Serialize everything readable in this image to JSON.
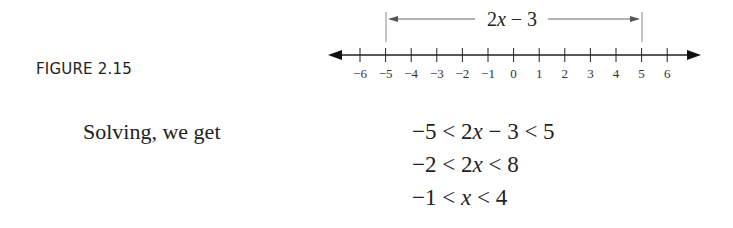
{
  "figure": {
    "label": "FIGURE 2.15",
    "number_line": {
      "ticks": [
        "−6",
        "−5",
        "−4",
        "−3",
        "−2",
        "−1",
        "0",
        "1",
        "2",
        "3",
        "4",
        "5",
        "6"
      ],
      "interval_label": "2x − 3",
      "interval_from": -5,
      "interval_to": 5
    }
  },
  "text": {
    "solving": "Solving, we get"
  },
  "equations": [
    "−5 < 2x − 3 < 5",
    "−2 < 2x < 8",
    "−1 < x < 4"
  ]
}
